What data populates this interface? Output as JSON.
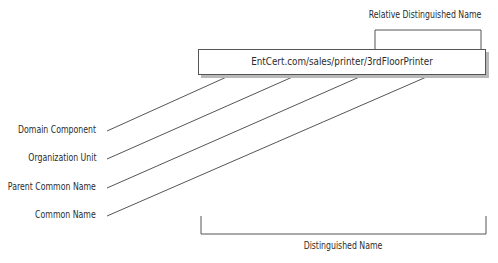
{
  "diagram": {
    "distinguished_name_string": "EntCert.com/sales/printer/3rdFloorPrinter",
    "top_label": "Relative Distinguished Name",
    "bottom_label": "Distinguished Name",
    "components": [
      {
        "label": "Domain Component"
      },
      {
        "label": "Organization Unit"
      },
      {
        "label": "Parent Common Name"
      },
      {
        "label": "Common Name"
      }
    ],
    "colors": {
      "line": "#555555",
      "text": "#2b2b2b",
      "box_shadow": "#b9b9b9"
    }
  }
}
